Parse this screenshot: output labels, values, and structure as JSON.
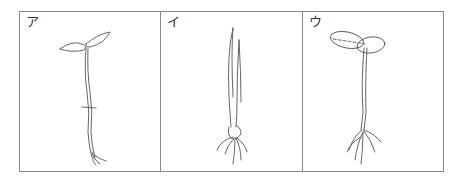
{
  "figure": {
    "panels": [
      {
        "label": "ア",
        "description": "dicot seedling with two small pointed leaves, long stem with a mark midway, short fibrous roots"
      },
      {
        "label": "イ",
        "description": "monocot seedling with narrow blade leaves and fibrous roots"
      },
      {
        "label": "ウ",
        "description": "dicot seedling with two round cotyledons, straight stem, branching roots"
      }
    ]
  }
}
